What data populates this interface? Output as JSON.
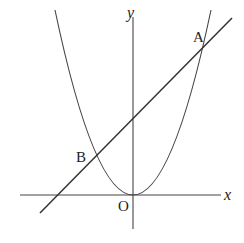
{
  "diagram": {
    "type": "coordinate-plot",
    "axes": {
      "x_label": "x",
      "y_label": "y",
      "origin_label": "O"
    },
    "points": {
      "A": {
        "label": "A"
      },
      "B": {
        "label": "B"
      }
    },
    "curves": [
      {
        "name": "parabola",
        "kind": "parabola",
        "vertex": "O"
      },
      {
        "name": "line",
        "kind": "line",
        "passes_through": [
          "A",
          "B"
        ]
      }
    ],
    "colors": {
      "stroke": "#444444",
      "background": "#ffffff"
    }
  }
}
